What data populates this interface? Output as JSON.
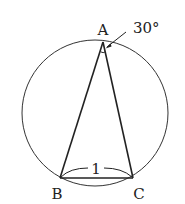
{
  "diagram": {
    "type": "inscribed-triangle",
    "circle": {
      "cx": 95,
      "cy": 113,
      "r": 73
    },
    "vertices": {
      "A": {
        "label": "A",
        "x": 103,
        "y": 42
      },
      "B": {
        "label": "B",
        "x": 60,
        "y": 178
      },
      "C": {
        "label": "C",
        "x": 133,
        "y": 178
      }
    },
    "angle_label": "30°",
    "side_label": "1",
    "colors": {
      "stroke": "#222222",
      "background": "#ffffff"
    }
  }
}
